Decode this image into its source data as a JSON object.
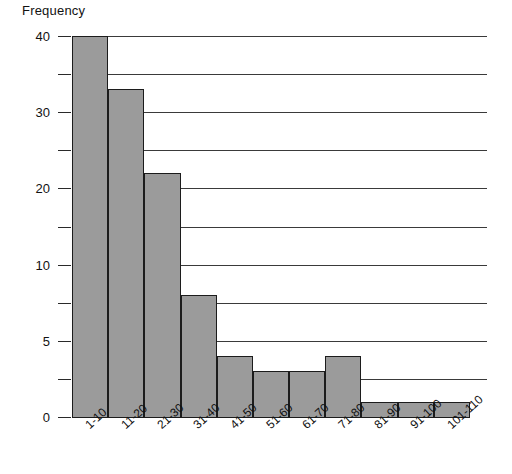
{
  "chart_data": {
    "type": "bar",
    "title": "",
    "ylabel": "Frequency",
    "xlabel": "",
    "categories": [
      "1-10",
      "11-20",
      "21-30",
      "31-40",
      "41-50",
      "51-60",
      "61-70",
      "71-80",
      "81-90",
      "91-100",
      "101-110"
    ],
    "values": [
      40,
      33,
      22,
      8,
      4,
      3,
      3,
      4,
      1,
      1,
      1
    ],
    "ytick_labels": [
      "0",
      "5",
      "10",
      "20",
      "30",
      "40"
    ],
    "ytick_values": [
      0,
      5,
      10,
      20,
      30,
      40
    ],
    "yaxis_note": "non-linear compressed axis: 10 evenly spaced gridlines, labelled 0, 5, 10, 20, 30, 40",
    "gridline_values": [
      0,
      2.5,
      5,
      7.5,
      10,
      15,
      20,
      25,
      30,
      35,
      40
    ],
    "ylim": [
      0,
      40
    ],
    "grid": "horizontal",
    "legend": "none",
    "bar_color": "#9b9b9b",
    "bar_edge_color": "#1c1c1c",
    "grid_color": "#3a3a3a"
  },
  "axis": {
    "y_title": "Frequency"
  }
}
